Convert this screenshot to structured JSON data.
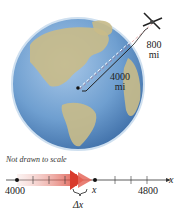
{
  "diagram": {
    "labels": {
      "satellite_distance_value": "800",
      "satellite_distance_unit": "mi",
      "earth_radius_value": "4000",
      "earth_radius_unit": "mi",
      "note": "Not drawn to scale"
    },
    "number_line": {
      "start_label": "4000",
      "point_label": "x",
      "end_label": "4800",
      "axis_label": "x",
      "delta_label": "Δx"
    },
    "colors": {
      "ocean": "#6f9fd0",
      "land": "#c9bb88",
      "arrow": "#d93a2b",
      "line": "#222222"
    }
  }
}
